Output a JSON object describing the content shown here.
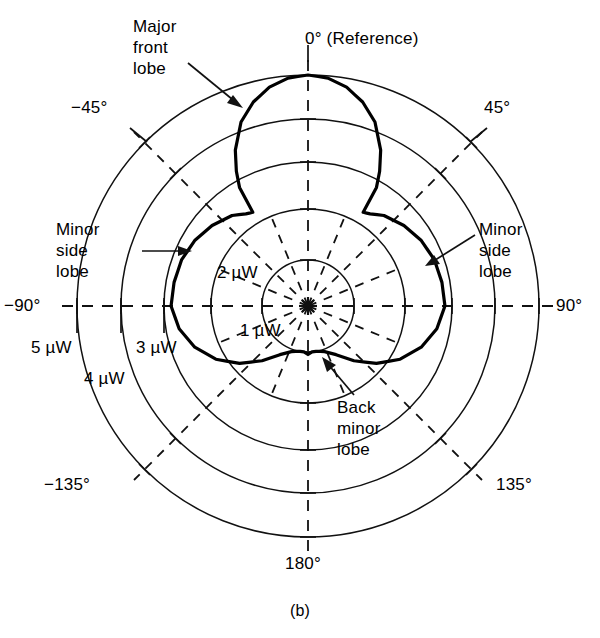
{
  "figure": {
    "caption": "(b)",
    "kind": "polar-radiation-pattern"
  },
  "angle_labels": {
    "deg0": "0° (Reference)",
    "deg45": "45°",
    "deg90": "90°",
    "deg135": "135°",
    "deg180": "180°",
    "degm45": "−45°",
    "degm90": "−90°",
    "degm135": "−135°"
  },
  "ring_labels": {
    "r1": "1 µW",
    "r2": "2 µW",
    "r3": "3 µW",
    "r4": "4 µW",
    "r5": "5 µW"
  },
  "annotations": {
    "major_front_lobe": "Major\nfront\nlobe",
    "minor_side_lobe_left": "Minor\nside\nlobe",
    "minor_side_lobe_right": "Minor\nside\nlobe",
    "back_minor_lobe": "Back\nminor\nlobe"
  },
  "colors": {
    "line": "#111111",
    "pattern": "#000000",
    "background": "#ffffff"
  },
  "chart_data": {
    "type": "line",
    "plot": "polar",
    "title": "",
    "xlabel": "Angle (degrees)",
    "ylabel": "Radiated power (µW)",
    "units": "µW",
    "grid": true,
    "legend": false,
    "angle_unit": "degrees",
    "angle_zero_at": "top",
    "angle_direction": "clockwise-positive",
    "radial_ticks": [
      1,
      2,
      3,
      4,
      5
    ],
    "radial_tick_labels": [
      "1 µW",
      "2 µW",
      "3 µW",
      "4 µW",
      "5 µW"
    ],
    "rlim": [
      0,
      5
    ],
    "angular_ticks": [
      0,
      45,
      90,
      135,
      180,
      -135,
      -90,
      -45
    ],
    "angular_tick_labels": [
      "0° (Reference)",
      "45°",
      "90°",
      "135°",
      "180°",
      "−135°",
      "−90°",
      "−45°"
    ],
    "series": [
      {
        "name": "Radiation pattern",
        "angles": [
          0,
          5,
          10,
          15,
          20,
          25,
          28,
          30,
          30.5,
          34,
          40,
          50,
          60,
          70,
          80,
          90,
          100,
          110,
          120,
          130,
          140,
          150,
          160,
          170,
          175,
          180,
          185,
          190,
          200,
          210,
          220,
          230,
          240,
          250,
          260,
          270,
          280,
          290,
          300,
          310,
          320,
          326,
          329.5,
          330,
          332,
          335,
          340,
          345,
          350,
          355,
          360
        ],
        "values": [
          5.0,
          4.95,
          4.8,
          4.55,
          4.2,
          3.65,
          3.2,
          2.85,
          2.25,
          2.3,
          2.45,
          2.6,
          2.72,
          2.8,
          2.83,
          2.85,
          2.72,
          2.5,
          2.2,
          1.85,
          1.5,
          1.2,
          1.05,
          1.0,
          1.0,
          1.05,
          1.0,
          1.0,
          1.05,
          1.2,
          1.5,
          1.85,
          2.2,
          2.5,
          2.72,
          2.85,
          2.83,
          2.8,
          2.72,
          2.6,
          2.45,
          2.3,
          2.25,
          2.85,
          3.2,
          3.65,
          4.2,
          4.55,
          4.8,
          4.95,
          5.0
        ],
        "features": [
          {
            "name": "major front lobe",
            "peak_angle": 0,
            "peak_value": 5.0
          },
          {
            "name": "minor side lobe (left)",
            "peak_angle": -90,
            "peak_value": 2.85
          },
          {
            "name": "minor side lobe (right)",
            "peak_angle": 90,
            "peak_value": 2.85
          },
          {
            "name": "back minor lobe",
            "peak_angle": 180,
            "peak_value": 1.05
          }
        ]
      }
    ]
  }
}
